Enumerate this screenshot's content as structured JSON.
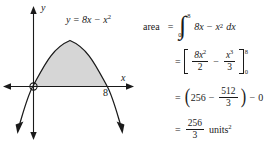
{
  "graph": {
    "axis_label_y": "y",
    "axis_label_x": "x",
    "tick_label": "8",
    "curve_label": {
      "lhs": "y",
      "equals": "=",
      "term1": "8x",
      "minus": "−",
      "term2_base": "x",
      "term2_exp": "2"
    },
    "fill_color": "#d6d6d6",
    "stroke_color": "#1a1a1a",
    "function": "y = 8x - x^2",
    "x_intercepts": [
      0,
      8
    ],
    "origin_marker": "circle"
  },
  "work": {
    "label": "area",
    "line1": {
      "equals": "=",
      "integral_symbol": "∫",
      "limit_lower": "0",
      "limit_upper": "8",
      "integrand_a": "8x",
      "minus": "−",
      "integrand_b_base": "x",
      "integrand_b_exp": "2",
      "differential": "dx"
    },
    "line2": {
      "equals": "=",
      "frac1_num_coeff": "8x",
      "frac1_num_exp": "2",
      "frac1_den": "2",
      "minus": "−",
      "frac2_num": "x",
      "frac2_num_exp": "3",
      "frac2_den": "3",
      "limit_upper": "8",
      "limit_lower": "0"
    },
    "line3": {
      "equals": "=",
      "value1": "256",
      "minus_inner": "−",
      "frac_num": "512",
      "frac_den": "3",
      "minus_outer": "−",
      "value2": "0"
    },
    "line4": {
      "equals": "=",
      "frac_num": "256",
      "frac_den": "3",
      "units_text": "units",
      "units_exp": "2"
    }
  }
}
